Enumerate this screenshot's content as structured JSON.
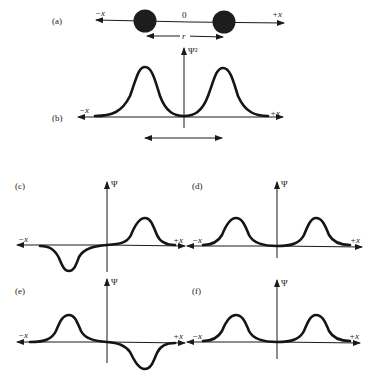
{
  "panels": {
    "a": {
      "label": "(a)",
      "neg_x": "−x",
      "pos_x": "+x",
      "origin": "0",
      "separation": "r"
    },
    "b": {
      "label": "(b)",
      "ylabel": "Ψ²",
      "neg_x": "−x",
      "pos_x": "+x",
      "separation": "r"
    },
    "c": {
      "label": "(c)",
      "ylabel": "Ψ",
      "neg_x": "−x",
      "pos_x": "+x"
    },
    "d": {
      "label": "(d)",
      "ylabel": "Ψ",
      "neg_x": "−x",
      "pos_x": "+x"
    },
    "e": {
      "label": "(e)",
      "ylabel": "Ψ",
      "neg_x": "−x",
      "pos_x": "+x"
    },
    "f": {
      "label": "(f)",
      "ylabel": "Ψ",
      "neg_x": "−x",
      "pos_x": "+x"
    }
  },
  "colors": {
    "ink": "#151515",
    "background": "#ffffff"
  }
}
